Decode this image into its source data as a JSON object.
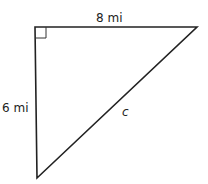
{
  "diagram": {
    "type": "right-triangle",
    "colors": {
      "stroke": "#222222",
      "background": "#ffffff"
    },
    "vertices": {
      "right_angle": [
        35,
        27
      ],
      "top_right": [
        197,
        27
      ],
      "bottom": [
        37,
        178
      ]
    },
    "labels": {
      "top_side": "8 mi",
      "left_side": "6 mi",
      "hypotenuse": "c"
    },
    "right_angle_marker_size": 11
  }
}
